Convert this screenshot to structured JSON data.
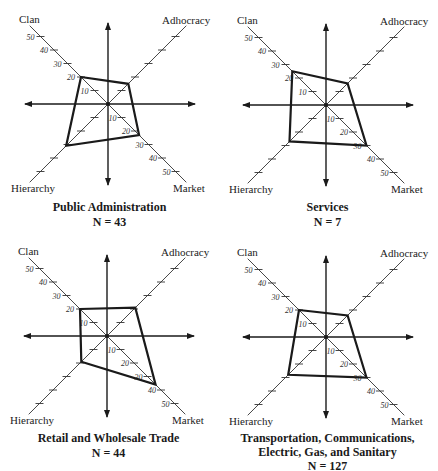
{
  "chart_data": [
    {
      "type": "radar",
      "title": "Public Administration",
      "subtitle": "N = 43",
      "axes": [
        "Clan",
        "Adhocracy",
        "Market",
        "Hierarchy"
      ],
      "tick_labels": [
        "10",
        "20",
        "30",
        "40",
        "50"
      ],
      "range": [
        0,
        50
      ],
      "values": {
        "Clan": 20,
        "Adhocracy": 15,
        "Market": 23,
        "Hierarchy": 31
      }
    },
    {
      "type": "radar",
      "title": "Services",
      "subtitle": "N = 7",
      "axes": [
        "Clan",
        "Adhocracy",
        "Market",
        "Hierarchy"
      ],
      "tick_labels": [
        "10",
        "20",
        "30",
        "40",
        "50"
      ],
      "range": [
        0,
        50
      ],
      "values": {
        "Clan": 25,
        "Adhocracy": 16,
        "Market": 30,
        "Hierarchy": 27
      }
    },
    {
      "type": "radar",
      "title": "Retail and Wholesale Trade",
      "subtitle": "N = 44",
      "axes": [
        "Clan",
        "Adhocracy",
        "Market",
        "Hierarchy"
      ],
      "tick_labels": [
        "10",
        "20",
        "30",
        "40",
        "50"
      ],
      "range": [
        0,
        50
      ],
      "values": {
        "Clan": 20,
        "Adhocracy": 21,
        "Market": 36,
        "Hierarchy": 19
      }
    },
    {
      "type": "radar",
      "title": "Transportation, Communications, Electric, Gas, and Sanitary",
      "title_lines": [
        "Transportation, Communications,",
        "Electric, Gas, and Sanitary"
      ],
      "subtitle": "N = 127",
      "axes": [
        "Clan",
        "Adhocracy",
        "Market",
        "Hierarchy"
      ],
      "tick_labels": [
        "10",
        "20",
        "30",
        "40",
        "50"
      ],
      "range": [
        0,
        50
      ],
      "values": {
        "Clan": 20,
        "Adhocracy": 16,
        "Market": 30,
        "Hierarchy": 28
      }
    }
  ],
  "panels": [
    {
      "title": "Public Administration",
      "subtitle": "N = 43",
      "labels": {
        "clan": "Clan",
        "adhocracy": "Adhocracy",
        "hierarchy": "Hierarchy",
        "market": "Market"
      }
    },
    {
      "title": "Services",
      "subtitle": "N = 7",
      "labels": {
        "clan": "Clan",
        "adhocracy": "Adhocracy",
        "hierarchy": "Hierarchy",
        "market": "Market"
      }
    },
    {
      "title": "Retail and Wholesale Trade",
      "subtitle": "N = 44",
      "labels": {
        "clan": "Clan",
        "adhocracy": "Adhocracy",
        "hierarchy": "Hierarchy",
        "market": "Market"
      }
    },
    {
      "title_line1": "Transportation, Communications,",
      "title_line2": "Electric, Gas, and Sanitary",
      "subtitle": "N = 127",
      "labels": {
        "clan": "Clan",
        "adhocracy": "Adhocracy",
        "hierarchy": "Hierarchy",
        "market": "Market"
      }
    }
  ],
  "colors": {
    "axis": "#333333",
    "profile": "#1a1a1a",
    "background": "#ffffff"
  }
}
